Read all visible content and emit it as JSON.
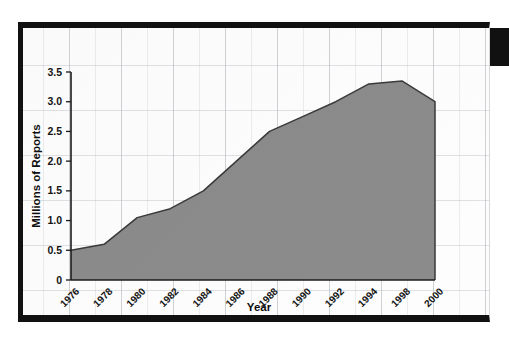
{
  "figure": {
    "background_color": "#fdfdfd",
    "frame_color": "#111111",
    "grid_color": "#a0a5ac"
  },
  "chart_data": {
    "type": "area",
    "title": "",
    "xlabel": "Year",
    "ylabel": "Millions of Reports",
    "xlim": [
      1976,
      2000
    ],
    "ylim": [
      0,
      3.5
    ],
    "grid": true,
    "legend": null,
    "series_color": "#8b8b8b",
    "line_color": "#3a3a3a",
    "x_tick_labels": [
      "1976",
      "1978",
      "1980",
      "1982",
      "1984",
      "1986",
      "1988",
      "1990",
      "1992",
      "1994",
      "1998",
      "2000"
    ],
    "y_tick_labels": [
      "0",
      "0.5",
      "1.0",
      "1.5",
      "2.0",
      "2.5",
      "3.0",
      "3.5"
    ],
    "y_tick_values": [
      0,
      0.5,
      1.0,
      1.5,
      2.0,
      2.5,
      3.0,
      3.5
    ],
    "x": [
      1976,
      1978,
      1980,
      1982,
      1984,
      1986,
      1988,
      1990,
      1992,
      1994,
      1998,
      2000
    ],
    "values": [
      0.5,
      0.6,
      1.05,
      1.2,
      1.5,
      2.0,
      2.5,
      2.75,
      3.0,
      3.3,
      3.35,
      3.0
    ],
    "series": [
      {
        "name": "Reports",
        "values": [
          0.5,
          0.6,
          1.05,
          1.2,
          1.5,
          2.0,
          2.5,
          2.75,
          3.0,
          3.3,
          3.35,
          3.0
        ]
      }
    ]
  }
}
